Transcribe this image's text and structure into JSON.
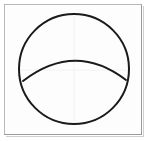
{
  "figure": {
    "title": "Circle with horizontal arc",
    "background_color": "#fdfdfd",
    "frame": {
      "label": "figure-border",
      "color": "#b8b8b8",
      "shadow_color": "#9a9a9a",
      "x": 4,
      "y": 4,
      "width": 138,
      "height": 131,
      "stroke_width": 1
    },
    "shapes": [
      {
        "name": "outer-circle",
        "type": "circle",
        "center_x": 74,
        "center_y": 69,
        "radius_x": 55,
        "radius_y": 55,
        "stroke_color": "#1a1a1a",
        "stroke_width": 2,
        "fill": "none"
      },
      {
        "name": "interior-arc",
        "type": "arc",
        "start_x": 23,
        "start_y": 81,
        "end_x": 126,
        "end_y": 80,
        "apex_x": 75,
        "apex_y": 57,
        "control_x": 75,
        "control_y": 41,
        "stroke_color": "#1a1a1a",
        "stroke_width": 2,
        "fill": "none"
      }
    ],
    "guides": [
      {
        "name": "vertical-center-guide",
        "type": "line",
        "x1": 74,
        "y1": 16,
        "x2": 74,
        "y2": 124,
        "stroke_color": "#f2f2f2"
      },
      {
        "name": "horizontal-center-guide",
        "type": "line",
        "x1": 20,
        "y1": 70,
        "x2": 128,
        "y2": 70,
        "stroke_color": "#f2f2f2"
      }
    ]
  }
}
